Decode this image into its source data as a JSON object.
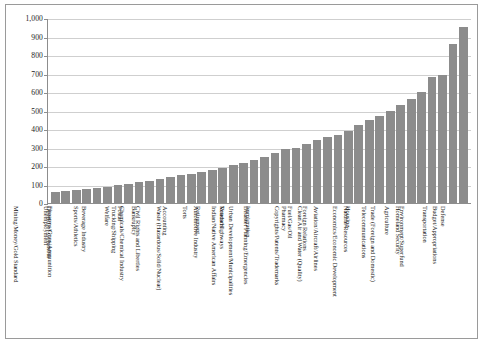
{
  "chart_data": {
    "type": "bar",
    "title": "",
    "subtitle": "",
    "xlabel": "",
    "ylabel": "",
    "ylim": [
      0,
      1000
    ],
    "ytick_labels": [
      "1,000",
      "900",
      "800",
      "700",
      "600",
      "500",
      "400",
      "300",
      "200",
      "100",
      "0"
    ],
    "ytick_values": [
      1000,
      900,
      800,
      700,
      600,
      500,
      400,
      300,
      200,
      100,
      0
    ],
    "grid": true,
    "legend": false,
    "bar_color": "#8c8c8c",
    "categories": [
      "Mining/Money/Gold Standard",
      "Unemployment",
      "District of Columbia",
      "Firearms/Guns/Ammunition",
      "Sports/Athletics",
      "Beverage Industry",
      "Welfare",
      "Postal",
      "Trucking/Shipping",
      "Bankruptcy",
      "Chemicals/Chemical Industry",
      "Civil Rights and Liberties",
      "Accounting",
      "Torts",
      "Waste (Hazardous/Solid/Nuclear)",
      "Retirement",
      "Automotive Industry",
      "Veterans",
      "Roads/Highways",
      "Indian/Native American Affairs",
      "Immigration",
      "Urban Development/Municipalities",
      "Disaster Planning/Emergencies",
      "Pharmacy",
      "Fuel/Gas/Oil",
      "Copyrights/Patents/Trademarks",
      "Foreign Relations",
      "Clean Air and Water (Quality)",
      "Aviation/Aircraft/Airlines",
      "Housing",
      "Natural Resources",
      "Economics/Economic Development",
      "Telecommunications",
      "Agriculture",
      "Trade (Foreign and Domestic)",
      "Homeland Security",
      "Environment/Superfund",
      "Transportation",
      "Defense",
      "Budget/Appropriations"
    ],
    "values": [
      60,
      65,
      70,
      75,
      80,
      88,
      95,
      105,
      115,
      120,
      130,
      140,
      150,
      158,
      165,
      178,
      190,
      205,
      218,
      230,
      250,
      268,
      290,
      300,
      318,
      340,
      355,
      370,
      390,
      420,
      450,
      470,
      498,
      530,
      560,
      600,
      680,
      690,
      860,
      950
    ]
  }
}
